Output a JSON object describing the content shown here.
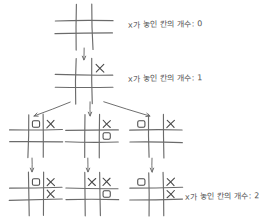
{
  "diagram": {
    "label_text_prefix": "x가 놓인 칸의 개수:",
    "labels": [
      {
        "id": "label-depth-0",
        "text": "x가 놓인 칸의 개수: 0",
        "count": "0",
        "x": 128,
        "y": 18
      },
      {
        "id": "label-depth-1",
        "text": "x가 놓인 칸의 개수: 1",
        "count": "1",
        "x": 128,
        "y": 72
      },
      {
        "id": "label-depth-2",
        "text": "x가 놓인 칸의 개수: 2",
        "count": "2",
        "x": 185,
        "y": 190
      }
    ],
    "boards": [
      {
        "id": "board-root",
        "name": "board-depth-0-empty",
        "x": 60,
        "y": 8,
        "w": 48,
        "h": 38,
        "cells": [
          "",
          "",
          "",
          "",
          "",
          "",
          "",
          "",
          ""
        ]
      },
      {
        "id": "board-d1-0",
        "name": "board-depth-1-x-top-right",
        "x": 60,
        "y": 62,
        "w": 48,
        "h": 38,
        "cells": [
          "",
          "",
          "x",
          "",
          "",
          "",
          "",
          "",
          ""
        ]
      },
      {
        "id": "board-d2-left",
        "name": "board-depth-2-left",
        "x": 14,
        "y": 118,
        "w": 44,
        "h": 36,
        "cells": [
          "",
          "o",
          "x",
          "",
          "",
          "",
          "",
          "",
          ""
        ]
      },
      {
        "id": "board-d2-mid",
        "name": "board-depth-2-middle",
        "x": 70,
        "y": 118,
        "w": 44,
        "h": 36,
        "cells": [
          "",
          "",
          "x",
          "",
          "",
          "o",
          "",
          "",
          ""
        ]
      },
      {
        "id": "board-d2-right",
        "name": "board-depth-2-right",
        "x": 134,
        "y": 118,
        "w": 44,
        "h": 36,
        "cells": [
          "o",
          "",
          "x",
          "",
          "",
          "",
          "",
          "",
          ""
        ]
      },
      {
        "id": "board-d3-left",
        "name": "board-depth-3-left",
        "x": 14,
        "y": 176,
        "w": 44,
        "h": 36,
        "cells": [
          "",
          "o",
          "x",
          "",
          "",
          "x",
          "",
          "",
          ""
        ]
      },
      {
        "id": "board-d3-mid",
        "name": "board-depth-3-middle",
        "x": 70,
        "y": 176,
        "w": 44,
        "h": 36,
        "cells": [
          "",
          "x",
          "x",
          "",
          "",
          "o",
          "",
          "",
          ""
        ]
      },
      {
        "id": "board-d3-right",
        "name": "board-depth-3-right",
        "x": 134,
        "y": 176,
        "w": 44,
        "h": 36,
        "cells": [
          "o",
          "",
          "x",
          "",
          "",
          "x",
          "",
          "",
          ""
        ]
      }
    ],
    "arrows": [
      {
        "id": "arrow-root-to-d1",
        "name": "arrow-down-root",
        "x1": 84,
        "y1": 48,
        "x2": 84,
        "y2": 60
      },
      {
        "id": "arrow-d1-to-left",
        "name": "arrow-branch-left",
        "x1": 70,
        "y1": 102,
        "x2": 34,
        "y2": 116
      },
      {
        "id": "arrow-d1-to-mid",
        "name": "arrow-branch-middle",
        "x1": 90,
        "y1": 102,
        "x2": 90,
        "y2": 116
      },
      {
        "id": "arrow-d1-to-right",
        "name": "arrow-branch-right",
        "x1": 104,
        "y1": 102,
        "x2": 150,
        "y2": 116
      },
      {
        "id": "arrow-d2left-to-d3",
        "name": "arrow-down-left",
        "x1": 32,
        "y1": 158,
        "x2": 32,
        "y2": 172
      },
      {
        "id": "arrow-d2mid-to-d3",
        "name": "arrow-down-middle",
        "x1": 88,
        "y1": 158,
        "x2": 88,
        "y2": 172
      },
      {
        "id": "arrow-d2right-to-d3",
        "name": "arrow-down-right",
        "x1": 152,
        "y1": 158,
        "x2": 152,
        "y2": 172
      }
    ],
    "colors": {
      "ink": "#4a4a4a",
      "grid": "#6b6b6b",
      "arrow": "#6f6f6f",
      "background": "#ffffff"
    }
  }
}
